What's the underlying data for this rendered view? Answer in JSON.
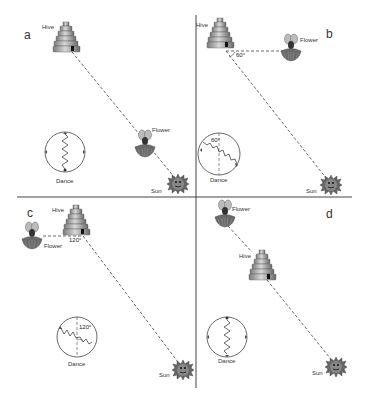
{
  "figure": {
    "dividers": {
      "vertical_x": 196,
      "horizontal_y": 197
    },
    "panels": [
      {
        "id": "a",
        "letter": "a",
        "hive_label": "Hive",
        "flower_label": "Flower",
        "sun_label": "Sun",
        "dance_label": "Dance",
        "angle_label": ""
      },
      {
        "id": "b",
        "letter": "b",
        "hive_label": "Hive",
        "flower_label": "Flower",
        "sun_label": "Sun",
        "dance_label": "Dance",
        "angle_label": "60°",
        "dance_angle_label": "60°"
      },
      {
        "id": "c",
        "letter": "c",
        "hive_label": "Hive",
        "flower_label": "Flower",
        "sun_label": "Sun",
        "dance_label": "Dance",
        "angle_label": "120°",
        "dance_angle_label": "120°"
      },
      {
        "id": "d",
        "letter": "d",
        "hive_label": "Hive",
        "flower_label": "Flower",
        "sun_label": "Sun",
        "dance_label": "Dance",
        "angle_label": ""
      }
    ],
    "colors": {
      "line": "#444444",
      "hive_light": "#c8c8c8",
      "hive_dark": "#6e6e6e",
      "sun": "#555555",
      "flower": "#777777"
    }
  }
}
